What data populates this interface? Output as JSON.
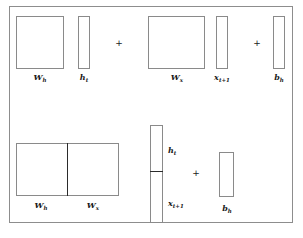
{
  "figure": {
    "caption_faint": "",
    "frame_color": "#8d8d8d",
    "block_border_color": "#8a8a8a",
    "text_color": "#1a1a1a",
    "background": "#ffffff"
  },
  "top_row": {
    "description": "Separate form: W_h h_t + W_x x_t+1 + b_h",
    "blocks": [
      {
        "name": "W_h",
        "base": "W",
        "sub": "h",
        "kind": "square-matrix"
      },
      {
        "name": "h_t",
        "base": "h",
        "sub": "t",
        "kind": "column-vector"
      },
      {
        "name": "W_x",
        "base": "W",
        "sub": "x",
        "kind": "square-matrix"
      },
      {
        "name": "x_t+1",
        "base": "x",
        "sub": "t+1",
        "kind": "column-vector"
      },
      {
        "name": "b_h",
        "base": "b",
        "sub": "h",
        "kind": "column-vector"
      }
    ],
    "operators": [
      "+",
      "+"
    ]
  },
  "bottom_row": {
    "description": "Concatenated form: [W_h W_x] [h_t ; x_t+1] + b_h",
    "weight_block": {
      "left": {
        "base": "W",
        "sub": "h"
      },
      "right": {
        "base": "W",
        "sub": "x"
      }
    },
    "stacked_vector": {
      "top": {
        "base": "h",
        "sub": "t"
      },
      "bottom": {
        "base": "x",
        "sub": "t+1"
      }
    },
    "bias": {
      "base": "b",
      "sub": "h"
    },
    "operators": [
      "+"
    ]
  }
}
